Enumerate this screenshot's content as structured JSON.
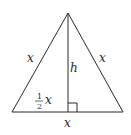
{
  "diagram": {
    "type": "isosceles-triangle-with-altitude",
    "stroke_color": "#2a2a2a",
    "labels": {
      "left_side": "x",
      "right_side": "x",
      "base": "x",
      "height": "h",
      "half_base_numerator": "1",
      "half_base_denominator": "2",
      "half_base_var": "x"
    },
    "right_angle_marker": true
  }
}
